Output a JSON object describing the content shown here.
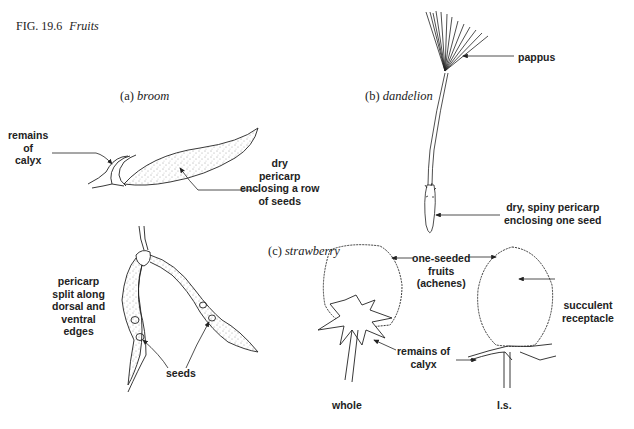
{
  "figure": {
    "number": "FIG. 19.6",
    "title": "Fruits"
  },
  "panels": {
    "broom": {
      "prefix": "(a)",
      "name": "broom",
      "labels": {
        "calyx": [
          "remains",
          "of",
          "calyx"
        ],
        "pericarp": [
          "dry",
          "pericarp",
          "enclosing a row",
          "of seeds"
        ],
        "split": [
          "pericarp",
          "split along",
          "dorsal and",
          "ventral",
          "edges"
        ],
        "seeds": "seeds"
      }
    },
    "dandelion": {
      "prefix": "(b)",
      "name": "dandelion",
      "labels": {
        "pappus": "pappus",
        "pericarp": [
          "dry, spiny pericarp",
          "enclosing one seed"
        ]
      }
    },
    "strawberry": {
      "prefix": "(c)",
      "name": "strawberry",
      "labels": {
        "achenes": [
          "one-seeded",
          "fruits",
          "(achenes)"
        ],
        "receptacle": [
          "succulent",
          "receptacle"
        ],
        "calyx": [
          "remains of",
          "calyx"
        ],
        "whole": "whole",
        "ls": "l.s."
      }
    }
  },
  "colors": {
    "ink": "#222222",
    "background": "#ffffff"
  }
}
